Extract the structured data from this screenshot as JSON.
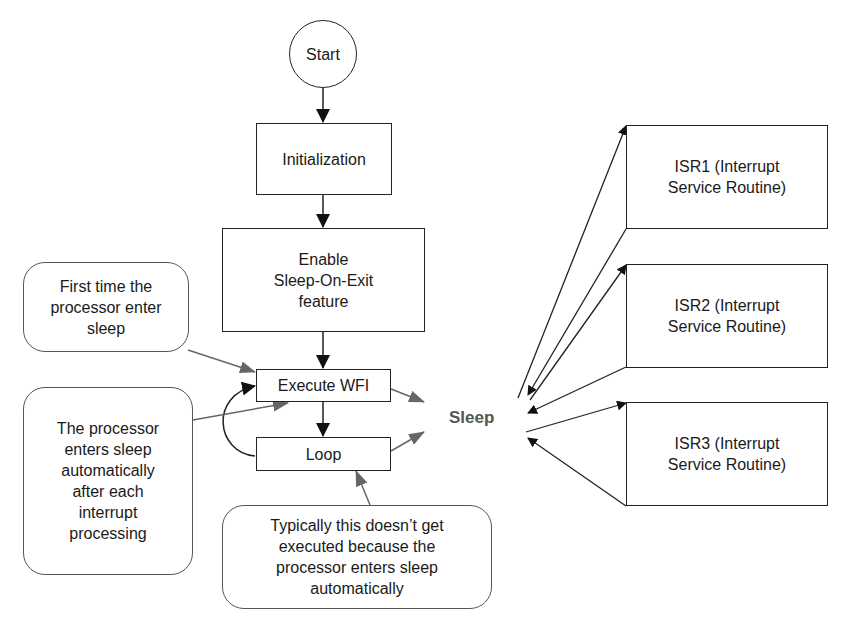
{
  "diagram": {
    "nodes": {
      "start": "Start",
      "init": "Initialization",
      "enable_line1": "Enable",
      "enable_line2": "Sleep-On-Exit",
      "enable_line3": "feature",
      "wfi": "Execute WFI",
      "loop": "Loop",
      "sleep": "Sleep",
      "isr1_line1": "ISR1 (Interrupt",
      "isr1_line2": "Service Routine)",
      "isr2_line1": "ISR2 (Interrupt",
      "isr2_line2": "Service Routine)",
      "isr3_line1": "ISR3 (Interrupt",
      "isr3_line2": "Service Routine)"
    },
    "notes": {
      "first_time": [
        "First time the",
        "processor enter",
        "sleep"
      ],
      "auto_sleep": [
        "The processor",
        "enters sleep",
        "automatically",
        "after each",
        "interrupt",
        "processing"
      ],
      "loop_note": [
        "Typically this doesn’t get",
        "executed because the",
        "processor enters sleep",
        "automatically"
      ]
    },
    "colors": {
      "line": "#222222",
      "annotation_arrow": "#666666",
      "sleep_text": "#555555"
    }
  }
}
